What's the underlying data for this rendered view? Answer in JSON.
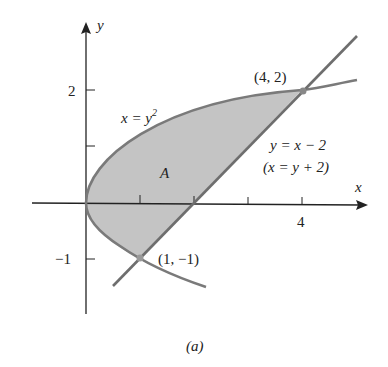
{
  "figure": {
    "caption": "(a)",
    "region_label": "A",
    "axes": {
      "x_label": "x",
      "y_label": "y",
      "x_tick_label_4": "4",
      "y_tick_label_2": "2",
      "y_tick_label_neg1": "−1"
    },
    "curves": {
      "parabola_label_lhs": "x = y",
      "parabola_label_exp": "2",
      "line_label": "y = x − 2",
      "line_label_alt": "(x = y + 2)"
    },
    "points": {
      "upper": "(4, 2)",
      "lower": "(1, −1)"
    },
    "colors": {
      "fill": "#c4c4c4",
      "curve": "#7a7a7a",
      "axis": "#222222"
    }
  }
}
